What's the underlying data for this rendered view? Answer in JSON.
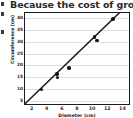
{
  "question_text": "Because the cost of grocerie",
  "margin_marks": [
    "mark",
    "mark",
    "mark"
  ],
  "colors": {
    "point": "#111111",
    "line": "#1c1c1c",
    "grid": "#dddddd",
    "border": "#1c1c1c",
    "text": "#2a2a2a",
    "background": "#ffffff"
  },
  "chart_data": {
    "type": "scatter",
    "title": "",
    "xlabel": "Diameter (cm)",
    "ylabel": "Circumference (cm)",
    "xlim": [
      1,
      15
    ],
    "ylim": [
      3,
      42
    ],
    "xticks": [
      2,
      4,
      6,
      8,
      10,
      12,
      14
    ],
    "yticks": [
      5,
      10,
      15,
      20,
      25,
      30,
      35,
      40
    ],
    "grid": true,
    "grid_axis": "y",
    "legend": "none",
    "points": [
      {
        "x": 3.2,
        "y": 10.0
      },
      {
        "x": 5.2,
        "y": 16.5
      },
      {
        "x": 5.3,
        "y": 15.0
      },
      {
        "x": 6.8,
        "y": 19.0
      },
      {
        "x": 10.2,
        "y": 32.0
      },
      {
        "x": 10.5,
        "y": 30.5
      },
      {
        "x": 12.6,
        "y": 39.5
      }
    ],
    "trend_line": {
      "label": "line of best fit",
      "x_start": 1.0,
      "y_start": 3.1,
      "x_end": 14.0,
      "y_end": 43.0
    }
  }
}
